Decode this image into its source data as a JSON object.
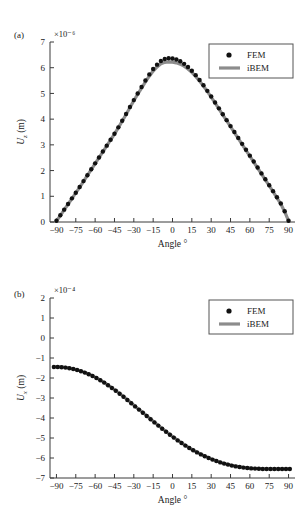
{
  "figure": {
    "panel_a_label": "(a)",
    "panel_b_label": "(b)"
  },
  "legend": {
    "fem_label": "FEM",
    "ibem_label": "iBEM"
  },
  "colors": {
    "fem_marker": "#111111",
    "ibem_line": "#8c8c8c",
    "axis": "#3a3a3a",
    "text": "#1a1a1a",
    "background": "#ffffff"
  },
  "chart_data": [
    {
      "type": "scatter",
      "panel": "(a)",
      "title": "",
      "xlabel": "Angle °",
      "ylabel": "U_z (m)",
      "y_exponent": "×10⁻⁶",
      "y_exponent_value": -6,
      "xlim": [
        -95,
        95
      ],
      "ylim": [
        0,
        7
      ],
      "xticks": [
        -90,
        -75,
        -60,
        -45,
        -30,
        -15,
        0,
        15,
        30,
        45,
        60,
        75,
        90
      ],
      "xticklabels": [
        "−90",
        "−75",
        "−60",
        "−45",
        "−30",
        "−15",
        "0",
        "15",
        "30",
        "45",
        "60",
        "75",
        "90"
      ],
      "yticks": [
        0,
        1,
        2,
        3,
        4,
        5,
        6,
        7
      ],
      "yticklabels": [
        "0",
        "1",
        "2",
        "3",
        "4",
        "5",
        "6",
        "7"
      ],
      "grid": false,
      "legend_position": "upper right",
      "series": [
        {
          "name": "FEM",
          "style": "markers",
          "x": [
            -90,
            -87,
            -84,
            -81,
            -78,
            -75,
            -72,
            -69,
            -66,
            -63,
            -60,
            -57,
            -54,
            -51,
            -48,
            -45,
            -42,
            -39,
            -36,
            -33,
            -30,
            -27,
            -24,
            -21,
            -18,
            -15,
            -12,
            -9,
            -6,
            -3,
            0,
            3,
            6,
            9,
            12,
            15,
            18,
            21,
            24,
            27,
            30,
            33,
            36,
            39,
            42,
            45,
            48,
            51,
            54,
            57,
            60,
            63,
            66,
            69,
            72,
            75,
            78,
            81,
            84,
            87,
            90
          ],
          "y": [
            0.05,
            0.26,
            0.48,
            0.7,
            0.92,
            1.14,
            1.36,
            1.59,
            1.82,
            2.05,
            2.28,
            2.51,
            2.74,
            2.97,
            3.2,
            3.43,
            3.68,
            3.94,
            4.2,
            4.47,
            4.74,
            5.0,
            5.25,
            5.5,
            5.74,
            5.95,
            6.12,
            6.26,
            6.34,
            6.37,
            6.36,
            6.32,
            6.25,
            6.15,
            6.03,
            5.88,
            5.71,
            5.52,
            5.32,
            5.1,
            4.88,
            4.65,
            4.42,
            4.19,
            3.96,
            3.73,
            3.5,
            3.27,
            3.04,
            2.81,
            2.58,
            2.35,
            2.12,
            1.89,
            1.66,
            1.43,
            1.2,
            0.96,
            0.72,
            0.42,
            0.05
          ]
        },
        {
          "name": "iBEM",
          "style": "line",
          "x": [
            -90,
            -87,
            -84,
            -81,
            -78,
            -75,
            -72,
            -69,
            -66,
            -63,
            -60,
            -57,
            -54,
            -51,
            -48,
            -45,
            -42,
            -39,
            -36,
            -33,
            -30,
            -27,
            -24,
            -21,
            -18,
            -15,
            -12,
            -9,
            -6,
            -3,
            0,
            3,
            6,
            9,
            12,
            15,
            18,
            21,
            24,
            27,
            30,
            33,
            36,
            39,
            42,
            45,
            48,
            51,
            54,
            57,
            60,
            63,
            66,
            69,
            72,
            75,
            78,
            81,
            84,
            87,
            90
          ],
          "y": [
            0.04,
            0.25,
            0.47,
            0.69,
            0.91,
            1.13,
            1.35,
            1.58,
            1.81,
            2.04,
            2.27,
            2.5,
            2.73,
            2.96,
            3.19,
            3.42,
            3.67,
            3.92,
            4.18,
            4.45,
            4.72,
            4.97,
            5.21,
            5.45,
            5.67,
            5.87,
            6.03,
            6.15,
            6.21,
            6.23,
            6.22,
            6.19,
            6.14,
            6.06,
            5.95,
            5.82,
            5.66,
            5.48,
            5.29,
            5.08,
            4.86,
            4.63,
            4.4,
            4.17,
            3.94,
            3.71,
            3.48,
            3.25,
            3.02,
            2.79,
            2.56,
            2.33,
            2.1,
            1.87,
            1.64,
            1.41,
            1.18,
            0.94,
            0.7,
            0.4,
            0.04
          ]
        }
      ]
    },
    {
      "type": "scatter",
      "panel": "(b)",
      "title": "",
      "xlabel": "Angle °",
      "ylabel": "U_x (m)",
      "y_exponent": "×10⁻⁴",
      "y_exponent_value": -4,
      "xlim": [
        -95,
        95
      ],
      "ylim": [
        -7,
        2
      ],
      "xticks": [
        -90,
        -75,
        -60,
        -45,
        -30,
        -15,
        0,
        15,
        30,
        45,
        60,
        75,
        90
      ],
      "xticklabels": [
        "−90",
        "−75",
        "−60",
        "−45",
        "−30",
        "−15",
        "0",
        "15",
        "30",
        "45",
        "60",
        "75",
        "90"
      ],
      "yticks": [
        -7,
        -6,
        -5,
        -4,
        -3,
        -2,
        -1,
        0,
        1,
        2
      ],
      "yticklabels": [
        "−7",
        "−6",
        "−5",
        "−4",
        "−3",
        "−2",
        "−1",
        "0",
        "1",
        "2"
      ],
      "grid": false,
      "legend_position": "upper right",
      "series": [
        {
          "name": "FEM",
          "style": "markers",
          "x": [
            -92,
            -89,
            -86,
            -83,
            -80,
            -77,
            -74,
            -71,
            -68,
            -65,
            -62,
            -59,
            -56,
            -53,
            -50,
            -47,
            -44,
            -41,
            -38,
            -35,
            -32,
            -29,
            -26,
            -23,
            -20,
            -17,
            -14,
            -11,
            -8,
            -5,
            -2,
            1,
            4,
            7,
            10,
            13,
            16,
            19,
            22,
            25,
            28,
            31,
            34,
            37,
            40,
            43,
            46,
            49,
            52,
            55,
            58,
            61,
            64,
            67,
            70,
            73,
            76,
            79,
            82,
            85,
            88,
            91
          ],
          "y": [
            -1.45,
            -1.45,
            -1.46,
            -1.48,
            -1.51,
            -1.55,
            -1.6,
            -1.66,
            -1.73,
            -1.81,
            -1.9,
            -2.0,
            -2.11,
            -2.23,
            -2.36,
            -2.5,
            -2.64,
            -2.79,
            -2.94,
            -3.1,
            -3.26,
            -3.42,
            -3.58,
            -3.74,
            -3.9,
            -4.06,
            -4.22,
            -4.38,
            -4.54,
            -4.69,
            -4.84,
            -4.98,
            -5.12,
            -5.25,
            -5.38,
            -5.5,
            -5.61,
            -5.72,
            -5.82,
            -5.91,
            -6.0,
            -6.08,
            -6.15,
            -6.22,
            -6.28,
            -6.33,
            -6.38,
            -6.42,
            -6.45,
            -6.48,
            -6.5,
            -6.52,
            -6.53,
            -6.54,
            -6.55,
            -6.55,
            -6.55,
            -6.55,
            -6.55,
            -6.55,
            -6.55,
            -6.55
          ]
        },
        {
          "name": "iBEM",
          "style": "line",
          "x": [
            -92,
            -89,
            -86,
            -83,
            -80,
            -77,
            -74,
            -71,
            -68,
            -65,
            -62,
            -59,
            -56,
            -53,
            -50,
            -47,
            -44,
            -41,
            -38,
            -35,
            -32,
            -29,
            -26,
            -23,
            -20,
            -17,
            -14,
            -11,
            -8,
            -5,
            -2,
            1,
            4,
            7,
            10,
            13,
            16,
            19,
            22,
            25,
            28,
            31,
            34,
            37,
            40,
            43,
            46,
            49,
            52,
            55,
            58,
            61,
            64,
            67,
            70,
            73,
            76,
            79,
            82,
            85,
            88,
            91
          ],
          "y": [
            -1.44,
            -1.44,
            -1.45,
            -1.47,
            -1.5,
            -1.54,
            -1.59,
            -1.65,
            -1.72,
            -1.8,
            -1.89,
            -1.99,
            -2.1,
            -2.22,
            -2.35,
            -2.49,
            -2.63,
            -2.78,
            -2.93,
            -3.09,
            -3.25,
            -3.41,
            -3.57,
            -3.73,
            -3.89,
            -4.05,
            -4.21,
            -4.37,
            -4.53,
            -4.68,
            -4.83,
            -4.97,
            -5.11,
            -5.24,
            -5.37,
            -5.49,
            -5.6,
            -5.71,
            -5.81,
            -5.9,
            -5.99,
            -6.07,
            -6.14,
            -6.21,
            -6.27,
            -6.32,
            -6.37,
            -6.41,
            -6.44,
            -6.47,
            -6.49,
            -6.51,
            -6.52,
            -6.53,
            -6.54,
            -6.54,
            -6.54,
            -6.54,
            -6.54,
            -6.54,
            -6.54,
            -6.54
          ]
        }
      ]
    }
  ]
}
